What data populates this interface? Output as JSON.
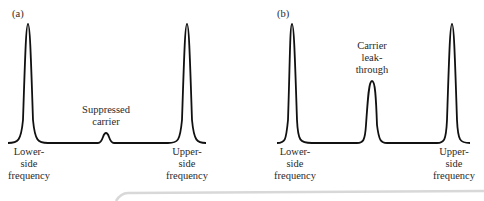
{
  "panels": [
    {
      "tag": "(a)",
      "lower": {
        "l1": "Lower-",
        "l2": "side",
        "l3": "frequency"
      },
      "center": {
        "l1": "Suppressed",
        "l2": "carrier"
      },
      "upper": {
        "l1": "Upper-",
        "l2": "side",
        "l3": "frequency"
      }
    },
    {
      "tag": "(b)",
      "lower": {
        "l1": "Lower-",
        "l2": "side",
        "l3": "frequency"
      },
      "center": {
        "l1": "Carrier",
        "l2": "leak-",
        "l3": "through"
      },
      "upper": {
        "l1": "Upper-",
        "l2": "side",
        "l3": "frequency"
      }
    }
  ],
  "colors": {
    "trace": "#111111",
    "text": "#2a2a2a",
    "shadow": "#d8d8d8"
  }
}
